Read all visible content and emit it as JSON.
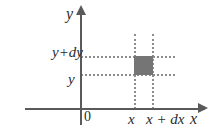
{
  "figure": {
    "background_color": "#ffffff"
  },
  "axes": {
    "x_label": "x",
    "y_label": "y",
    "origin_label": "0",
    "axis_color": "#5a5a5a",
    "arrow_x_name": "x-axis-arrowhead",
    "arrow_y_name": "y-axis-arrowhead"
  },
  "guides": {
    "line_color": "#8d8d8d",
    "style": "dotted",
    "horizontal": [
      {
        "name": "guide-y-plus-dy",
        "value_label": "y+dy"
      },
      {
        "name": "guide-y",
        "value_label": "y"
      }
    ],
    "vertical": [
      {
        "name": "guide-x",
        "value_label": "x"
      },
      {
        "name": "guide-x-plus-dx",
        "value_label": "x+dx"
      }
    ]
  },
  "tick_labels": {
    "y_upper": "y+dy",
    "y_lower": "y",
    "x_left": "x",
    "x_right": "x + dx"
  },
  "area_element": {
    "name": "shaded-area-element",
    "fill_color": "#757575",
    "width_label": "dx",
    "height_label": "dy"
  },
  "chart_data": {
    "type": "scatter",
    "xlabel": "x",
    "ylabel": "y",
    "grid": false,
    "legend": null,
    "xlim": [
      0,
      7
    ],
    "ylim": [
      0,
      5
    ],
    "annotations": [
      {
        "text": "y+dy",
        "axis": "y",
        "position": "upper-guide"
      },
      {
        "text": "y",
        "axis": "y",
        "position": "lower-guide"
      },
      {
        "text": "x",
        "axis": "x",
        "position": "left-guide"
      },
      {
        "text": "x + dx",
        "axis": "x",
        "position": "right-guide"
      },
      {
        "text": "0",
        "axis": "origin",
        "position": "origin"
      }
    ],
    "shaded_region": {
      "x0_label": "x",
      "x1_label": "x + dx",
      "y0_label": "y",
      "y1_label": "y + dy",
      "fill": "#757575"
    }
  }
}
